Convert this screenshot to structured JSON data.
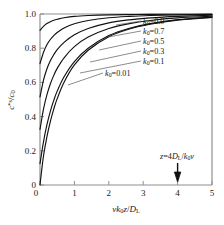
{
  "chart_data": {
    "type": "line",
    "title": "",
    "xlabel": "v k0 z / DL",
    "xlabel_parts": {
      "v": "v",
      "k": "k",
      "ksub": "0",
      "z": "z",
      "slash": "/",
      "D": "D",
      "Dsub": "L"
    },
    "ylabel": "c*s / c0",
    "ylabel_parts": {
      "c": "c",
      "star": "*",
      "s": "s",
      "slash": "/",
      "c2": "c",
      "c2sub": "0"
    },
    "xlim": [
      0,
      5
    ],
    "ylim": [
      0,
      1
    ],
    "xticks": [
      0,
      1,
      2,
      3,
      4,
      5
    ],
    "xtick_labels": [
      "0",
      "1",
      "2",
      "3",
      "4",
      "5"
    ],
    "yticks": [
      0,
      0.2,
      0.4,
      0.6,
      0.8,
      1.0
    ],
    "ytick_labels": [
      "0",
      "0.2",
      "0.4",
      "0.6",
      "0.8",
      "1.0"
    ],
    "grid": false,
    "legend_position": "inline-labels",
    "annotation": {
      "text": "z = 4DL/k0v",
      "parts": {
        "z": "z",
        "eq": "=",
        "four": "4",
        "D": "D",
        "Dsub": "L",
        "slash": "/",
        "k": "k",
        "ksub": "0",
        "v": "v"
      },
      "x": 4,
      "marker": "down-arrow"
    },
    "series": [
      {
        "name": "k0 = 0.9",
        "label": "k0=0.9",
        "label_parts": {
          "k": "k",
          "sub": "0",
          "eq": "=",
          "value": "0.9"
        },
        "k0": 0.9,
        "x": [
          0,
          0.1,
          0.2,
          0.3,
          0.4,
          0.5,
          0.7,
          1.0,
          1.4,
          2.0,
          2.6,
          3.2,
          4.0,
          5.0
        ],
        "y": [
          0.905,
          0.928,
          0.944,
          0.955,
          0.963,
          0.969,
          0.978,
          0.986,
          0.991,
          0.995,
          0.9965,
          0.9975,
          0.9985,
          0.999
        ]
      },
      {
        "name": "k0 = 0.7",
        "label": "k0=0.7",
        "label_parts": {
          "k": "k",
          "sub": "0",
          "eq": "=",
          "value": "0.7"
        },
        "k0": 0.7,
        "x": [
          0,
          0.1,
          0.2,
          0.3,
          0.4,
          0.5,
          0.7,
          1.0,
          1.4,
          2.0,
          2.6,
          3.2,
          4.0,
          5.0
        ],
        "y": [
          0.71,
          0.775,
          0.82,
          0.851,
          0.874,
          0.892,
          0.918,
          0.943,
          0.962,
          0.978,
          0.986,
          0.991,
          0.995,
          0.997
        ]
      },
      {
        "name": "k0 = 0.5",
        "label": "k0=0.5",
        "label_parts": {
          "k": "k",
          "sub": "0",
          "eq": "=",
          "value": "0.5"
        },
        "k0": 0.5,
        "x": [
          0,
          0.1,
          0.2,
          0.3,
          0.4,
          0.5,
          0.7,
          1.0,
          1.4,
          2.0,
          2.6,
          3.2,
          4.0,
          5.0
        ],
        "y": [
          0.515,
          0.612,
          0.678,
          0.726,
          0.762,
          0.791,
          0.834,
          0.878,
          0.915,
          0.948,
          0.966,
          0.977,
          0.986,
          0.993
        ]
      },
      {
        "name": "k0 = 0.3",
        "label": "k0=0.3",
        "label_parts": {
          "k": "k",
          "sub": "0",
          "eq": "=",
          "value": "0.3"
        },
        "k0": 0.3,
        "x": [
          0,
          0.1,
          0.2,
          0.3,
          0.4,
          0.5,
          0.7,
          1.0,
          1.4,
          2.0,
          2.6,
          3.2,
          4.0,
          5.0
        ],
        "y": [
          0.325,
          0.442,
          0.527,
          0.591,
          0.641,
          0.682,
          0.744,
          0.809,
          0.865,
          0.915,
          0.944,
          0.962,
          0.977,
          0.987
        ]
      },
      {
        "name": "k0 = 0.1",
        "label": "k0=0.1",
        "label_parts": {
          "k": "k",
          "sub": "0",
          "eq": "=",
          "value": "0.1"
        },
        "k0": 0.1,
        "x": [
          0,
          0.1,
          0.2,
          0.3,
          0.4,
          0.5,
          0.7,
          1.0,
          1.4,
          2.0,
          2.6,
          3.2,
          4.0,
          5.0
        ],
        "y": [
          0.125,
          0.251,
          0.351,
          0.431,
          0.495,
          0.549,
          0.633,
          0.722,
          0.8,
          0.874,
          0.917,
          0.944,
          0.967,
          0.982
        ]
      },
      {
        "name": "k0 = 0.01",
        "label": "k0=0.01",
        "label_parts": {
          "k": "k",
          "sub": "0",
          "eq": "=",
          "value": "0.01"
        },
        "k0": 0.01,
        "x": [
          0,
          0.1,
          0.2,
          0.3,
          0.4,
          0.5,
          0.7,
          1.0,
          1.4,
          2.0,
          2.6,
          3.2,
          4.0,
          5.0
        ],
        "y": [
          0.0,
          0.168,
          0.281,
          0.371,
          0.444,
          0.505,
          0.601,
          0.702,
          0.788,
          0.867,
          0.912,
          0.94,
          0.964,
          0.98
        ]
      }
    ],
    "colors": {
      "curve": "#111111",
      "axis": "#8f8f8f",
      "text": "#1a1a1a",
      "leader": "#5a5a5a",
      "background": "#ffffff"
    }
  }
}
